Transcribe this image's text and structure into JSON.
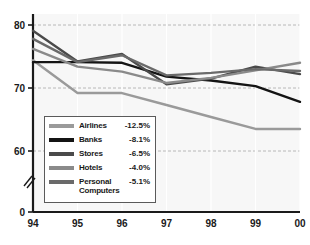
{
  "chart_data": {
    "type": "line",
    "title": "",
    "xlabel": "",
    "ylabel": "",
    "x": [
      "94",
      "95",
      "96",
      "97",
      "98",
      "99",
      "00"
    ],
    "xtick_labels": [
      "94",
      "95",
      "96",
      "97",
      "98",
      "99",
      "00"
    ],
    "ytick_labels": [
      "80",
      "70",
      "60",
      "0"
    ],
    "ytick_values": [
      80,
      70,
      60,
      0
    ],
    "ylim": [
      0,
      84
    ],
    "y_axis_break": true,
    "y_axis_break_symbol": "//",
    "grid": "horizontal-dashed",
    "legend_position": "inside-lower-left",
    "series": [
      {
        "name": "Airlines",
        "change_label": "-12.5%",
        "color": "#9a9a9a",
        "values": [
          74.4,
          69.2,
          69.2,
          67.3,
          65.4,
          63.5,
          63.5
        ]
      },
      {
        "name": "Banks",
        "change_label": "-8.1%",
        "color": "#141414",
        "values": [
          74.1,
          74.1,
          74.0,
          71.8,
          71.2,
          70.3,
          67.8
        ]
      },
      {
        "name": "Stores",
        "change_label": "-6.5%",
        "color": "#4a4a4a",
        "values": [
          79.1,
          74.2,
          75.4,
          70.6,
          71.5,
          73.4,
          72.2
        ]
      },
      {
        "name": "Hotels",
        "change_label": "-4.0%",
        "color": "#8a8a8a",
        "values": [
          76.2,
          73.4,
          72.6,
          70.8,
          71.6,
          72.8,
          74.0
        ]
      },
      {
        "name": "Personal\nComputers",
        "change_label": "-5.1%",
        "color": "#6a6a6a",
        "values": [
          77.8,
          74.1,
          75.2,
          72.0,
          72.4,
          73.0,
          72.7
        ]
      }
    ]
  },
  "axis": {
    "y_labels": [
      {
        "text": "80",
        "value": 80
      },
      {
        "text": "70",
        "value": 70
      },
      {
        "text": "60",
        "value": 60
      },
      {
        "text": "0",
        "value": 0
      }
    ],
    "x_labels": [
      "94",
      "95",
      "96",
      "97",
      "98",
      "99",
      "00"
    ],
    "break_glyph": "//"
  },
  "legend": {
    "rows": [
      {
        "name": "Airlines",
        "value": "-12.5%",
        "color": "#9a9a9a"
      },
      {
        "name": "Banks",
        "value": "-8.1%",
        "color": "#141414"
      },
      {
        "name": "Stores",
        "value": "-6.5%",
        "color": "#4a4a4a"
      },
      {
        "name": "Hotels",
        "value": "-4.0%",
        "color": "#8a8a8a"
      },
      {
        "name": "Personal\nComputers",
        "value": "-5.1%",
        "color": "#6a6a6a"
      }
    ]
  },
  "style": {
    "plot_background": "#f7f7f7",
    "axis_color": "#1a1a1a",
    "grid_color": "#b8b8b8",
    "legend_border": "#5a5a5a",
    "legend_background": "#ffffff"
  }
}
